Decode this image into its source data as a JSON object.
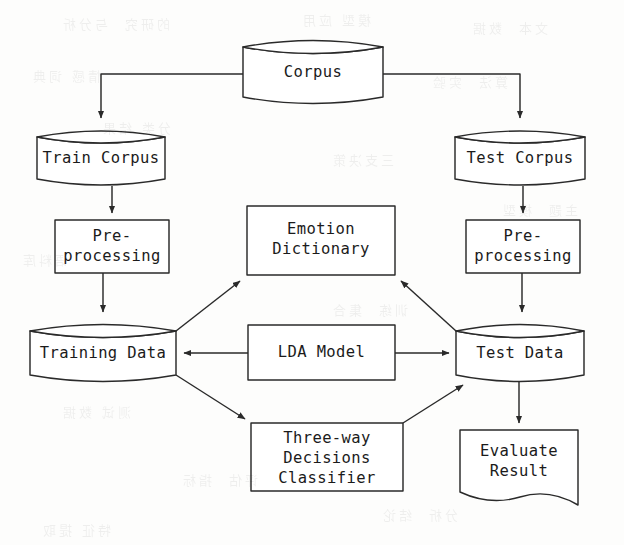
{
  "diagram": {
    "stroke_color": "#2a2a2a",
    "fill_color": "#ffffff",
    "background_color": "#fdfdfc",
    "nodes": [
      {
        "id": "corpus",
        "label": "Corpus",
        "shape": "cylinder"
      },
      {
        "id": "train_corpus",
        "label": "Train Corpus",
        "shape": "cylinder"
      },
      {
        "id": "test_corpus",
        "label": "Test Corpus",
        "shape": "cylinder"
      },
      {
        "id": "pre_left",
        "label": "Pre-\nprocessing",
        "shape": "rectangle"
      },
      {
        "id": "pre_right",
        "label": "Pre-\nprocessing",
        "shape": "rectangle"
      },
      {
        "id": "emotion_dict",
        "label": "Emotion\nDictionary",
        "shape": "rectangle"
      },
      {
        "id": "training_data",
        "label": "Training Data",
        "shape": "cylinder"
      },
      {
        "id": "lda_model",
        "label": "LDA Model",
        "shape": "rectangle"
      },
      {
        "id": "test_data",
        "label": "Test Data",
        "shape": "cylinder"
      },
      {
        "id": "classifier",
        "label": "Three-way\nDecisions\nClassifier",
        "shape": "rectangle"
      },
      {
        "id": "evaluate",
        "label": "Evaluate\nResult",
        "shape": "document"
      }
    ],
    "edges": [
      {
        "from": "corpus",
        "to": "train_corpus",
        "style": "elbow",
        "arrow": true
      },
      {
        "from": "corpus",
        "to": "test_corpus",
        "style": "elbow",
        "arrow": true
      },
      {
        "from": "train_corpus",
        "to": "pre_left",
        "style": "straight",
        "arrow": true
      },
      {
        "from": "test_corpus",
        "to": "pre_right",
        "style": "straight",
        "arrow": true
      },
      {
        "from": "pre_left",
        "to": "training_data",
        "style": "straight",
        "arrow": true
      },
      {
        "from": "pre_right",
        "to": "test_data",
        "style": "straight",
        "arrow": true
      },
      {
        "from": "training_data",
        "to": "emotion_dict",
        "style": "diagonal",
        "arrow": true
      },
      {
        "from": "test_data",
        "to": "emotion_dict",
        "style": "diagonal",
        "arrow": true
      },
      {
        "from": "lda_model",
        "to": "training_data",
        "style": "straight",
        "arrow": true
      },
      {
        "from": "lda_model",
        "to": "test_data",
        "style": "straight",
        "arrow": true
      },
      {
        "from": "training_data",
        "to": "classifier",
        "style": "diagonal",
        "arrow": true
      },
      {
        "from": "classifier",
        "to": "test_data",
        "style": "diagonal",
        "arrow": true
      },
      {
        "from": "test_data",
        "to": "evaluate",
        "style": "straight",
        "arrow": true
      }
    ],
    "bleed_artifacts": [
      {
        "text": "的研究  与分析",
        "x": 60,
        "y": 14
      },
      {
        "text": "模型 应用",
        "x": 300,
        "y": 10
      },
      {
        "text": "文本  数据",
        "x": 470,
        "y": 18
      },
      {
        "text": "情感 词典",
        "x": 30,
        "y": 66
      },
      {
        "text": "算法  实验",
        "x": 430,
        "y": 72
      },
      {
        "text": "分类 结果",
        "x": 100,
        "y": 118
      },
      {
        "text": "三支决策",
        "x": 330,
        "y": 150
      },
      {
        "text": "主题  模型",
        "x": 500,
        "y": 200
      },
      {
        "text": "语料库",
        "x": 20,
        "y": 250
      },
      {
        "text": "训练  集合",
        "x": 330,
        "y": 300
      },
      {
        "text": "测试 数据",
        "x": 60,
        "y": 402
      },
      {
        "text": "评估  指标",
        "x": 180,
        "y": 470
      },
      {
        "text": "分析  结论",
        "x": 380,
        "y": 505
      },
      {
        "text": "特征 提取",
        "x": 40,
        "y": 520
      }
    ]
  }
}
